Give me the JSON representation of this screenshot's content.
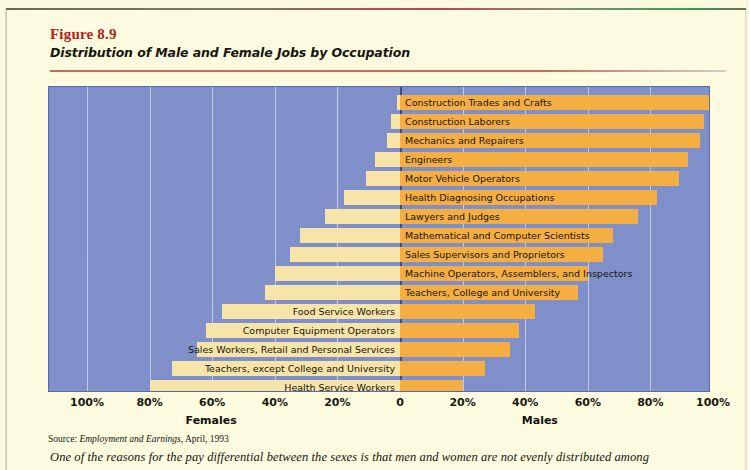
{
  "figure": {
    "number": "Figure 8.9",
    "title": "Distribution of Male and Female Jobs by Occupation",
    "source_prefix": "Source:",
    "source_italic": "Employment and Earnings,",
    "source_rest": "April, 1993",
    "caption": "One of the reasons for the pay differential between the sexes is that men and women are not evenly distributed among"
  },
  "colors": {
    "plot_background": "#7f8fcb",
    "male_bar": "#f5ae42",
    "female_bar": "#f7e4a9",
    "gridline": "#cdd6ee",
    "zero_line": "#3d4a86",
    "page_background": "#fcfbe0",
    "figure_number": "#b02318"
  },
  "chart_data": {
    "type": "bar",
    "subtype": "diverging-horizontal-population-pyramid",
    "title": "Distribution of Male and Female Jobs by Occupation",
    "xlabel": "",
    "ylabel": "",
    "grid": true,
    "legend": "none",
    "axis_left_name": "Females",
    "axis_right_name": "Males",
    "xticks": [
      "100%",
      "80%",
      "60%",
      "40%",
      "20%",
      "0",
      "20%",
      "40%",
      "60%",
      "80%",
      "100%"
    ],
    "xtick_values": [
      -100,
      -80,
      -60,
      -40,
      -20,
      0,
      20,
      40,
      60,
      80,
      100
    ],
    "xlim": [
      -100,
      100
    ],
    "categories": [
      "Construction Trades and Crafts",
      "Construction Laborers",
      "Mechanics and Repairers",
      "Engineers",
      "Motor Vehicle Operators",
      "Health Diagnosing Occupations",
      "Lawyers and Judges",
      "Mathematical and Computer Scientists",
      "Sales Supervisors and Proprietors",
      "Machine Operators, Assemblers, and Inspectors",
      "Teachers, College and University",
      "Food Service Workers",
      "Computer Equipment Operators",
      "Sales Workers, Retail and Personal Services",
      "Teachers, except College and University",
      "Health Service Workers",
      "Private Household Service Workers",
      "Secretaries, Stenographers, and Typists"
    ],
    "series": [
      {
        "name": "Males",
        "values": [
          99,
          97,
          96,
          92,
          89,
          82,
          76,
          68,
          65,
          60,
          57,
          43,
          38,
          35,
          27,
          20,
          5,
          2
        ]
      },
      {
        "name": "Females",
        "values": [
          1,
          3,
          4,
          8,
          11,
          18,
          24,
          32,
          35,
          40,
          43,
          57,
          62,
          65,
          73,
          80,
          95,
          98
        ]
      }
    ],
    "label_side": [
      "right",
      "right",
      "right",
      "right",
      "right",
      "right",
      "right",
      "right",
      "right",
      "right",
      "right",
      "left",
      "left",
      "left",
      "left",
      "left",
      "left",
      "left"
    ]
  }
}
